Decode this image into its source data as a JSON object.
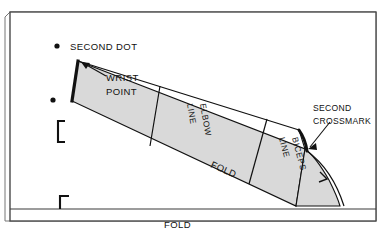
{
  "figure": {
    "type": "sewing-pattern-diagram",
    "colors": {
      "paper": "#ffffff",
      "pattern_fill": "#d9d9d9",
      "line": "#111111",
      "frame": "#555555"
    }
  },
  "labels": {
    "second_dot": "SECOND  DOT",
    "wrist_point_line1": "WRIST",
    "wrist_point_line2": "POINT",
    "elbow_line_word1": "ELBOW",
    "elbow_line_word2": "LINE",
    "biceps_line_word1": "BICEPS",
    "biceps_line_word2": "LINE",
    "fold_inner": "FOLD",
    "fold_bottom": "FOLD",
    "second_crossmark_line1": "SECOND",
    "second_crossmark_line2": "CROSSMARK"
  },
  "markers": {
    "dot_top": "dot-marker",
    "dot_left": "dot-marker",
    "notch_armhole": "notch-mark",
    "bracket_left": "corner-bracket",
    "bracket_bottom": "corner-bracket"
  }
}
